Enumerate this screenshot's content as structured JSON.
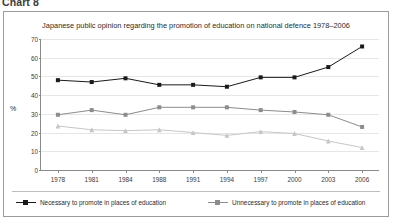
{
  "caption": "Chart 8",
  "axis": {
    "ylabel": "%",
    "yticks": [
      "0",
      "10",
      "20",
      "30",
      "40",
      "50",
      "60",
      "70"
    ],
    "xticks": [
      "1978",
      "1981",
      "1984",
      "1988",
      "1991",
      "1994",
      "1997",
      "2000",
      "2003",
      "2006"
    ]
  },
  "legend": {
    "items": [
      {
        "label": "Necessary to promote in places of education",
        "color": "#1a1a1a",
        "marker": "square"
      },
      {
        "label": "Unnecessary to promote in places of education",
        "color": "#8c8c8c",
        "marker": "square"
      },
      {
        "label": "No opinion",
        "color": "#c6c6c6",
        "marker": "triangle"
      }
    ]
  },
  "chart_data": {
    "type": "line",
    "title": "Japanese public opinion regarding the promotion of education on national defence 1978–2006",
    "xlabel": "",
    "ylabel": "%",
    "ylim": [
      0,
      70
    ],
    "ytick_step": 10,
    "grid": true,
    "legend_position": "bottom",
    "categories": [
      "1978",
      "1981",
      "1984",
      "1988",
      "1991",
      "1994",
      "1997",
      "2000",
      "2003",
      "2006"
    ],
    "series": [
      {
        "name": "Necessary to promote in places of education",
        "color": "#1a1a1a",
        "marker": "square",
        "values": [
          48,
          47,
          49,
          45.5,
          45.5,
          44.5,
          49.5,
          49.5,
          55,
          66
        ]
      },
      {
        "name": "Unnecessary to promote in places of education",
        "color": "#8c8c8c",
        "marker": "square",
        "values": [
          29.5,
          32,
          29.5,
          33.5,
          33.5,
          33.5,
          32,
          31,
          29.5,
          23
        ]
      },
      {
        "name": "No opinion",
        "color": "#c6c6c6",
        "marker": "triangle",
        "values": [
          23.5,
          21.5,
          21,
          21.5,
          20,
          18.5,
          20.5,
          19.5,
          15.5,
          12
        ]
      }
    ]
  }
}
